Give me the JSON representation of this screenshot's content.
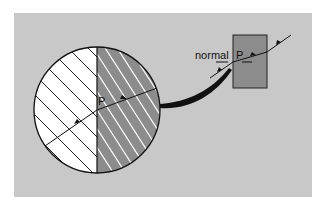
{
  "diagram": {
    "background_color": "#ffffff",
    "panel_color": "#c8c8c8",
    "circle": {
      "left_half_color": "#ffffff",
      "right_half_color": "#8c8c8c",
      "point_label": "P"
    },
    "inset": {
      "box_color": "#8c8c8c",
      "point_label": "P",
      "normal_label": "normal"
    }
  }
}
